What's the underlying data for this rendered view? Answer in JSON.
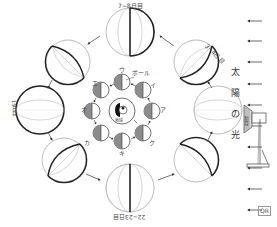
{
  "figure": {
    "type": "moon-phase-diagram",
    "colors": {
      "line": "#222222",
      "thin_line": "#999999",
      "shadow": "#8c8c8c",
      "background": "#ffffff"
    }
  },
  "outer_moons": {
    "labels": {
      "top": "7~8日目",
      "top_right": "3~4日目",
      "right": "新月",
      "left": "15日目",
      "bottom": "22~23日目"
    }
  },
  "inner_moons": {
    "labels": [
      "ア",
      "イ",
      "ウ",
      "エ",
      "オ",
      "カ",
      "キ",
      "ク"
    ],
    "ball_label": "ボール"
  },
  "center": {
    "label": "地球"
  },
  "sunlight": {
    "chars": [
      "太",
      "陽",
      "の",
      "光"
    ],
    "arrow_count": 10
  },
  "qr": {
    "label": "QR"
  }
}
